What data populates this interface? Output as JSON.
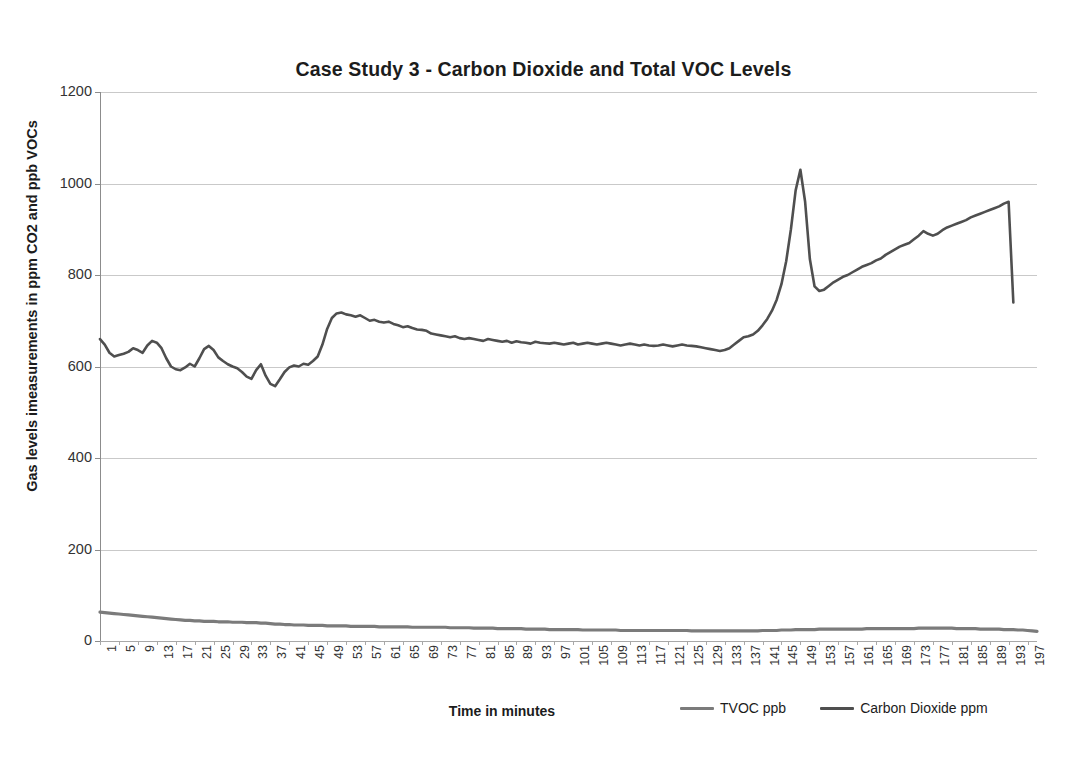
{
  "chart_data": {
    "type": "line",
    "title": "Case Study 3 - Carbon Dioxide and Total VOC Levels",
    "xlabel": "Time in minutes",
    "ylabel": "Gas levels imeasurements in ppm CO2 and ppb VOCs",
    "ylim": [
      0,
      1200
    ],
    "ytick_values": [
      0,
      200,
      400,
      600,
      800,
      1000,
      1200
    ],
    "ytick_labels": [
      "0",
      "200",
      "400",
      "600",
      "800",
      "1000",
      "1200"
    ],
    "xlim": [
      1,
      200
    ],
    "xtick_labels": [
      "1",
      "5",
      "9",
      "13",
      "17",
      "21",
      "25",
      "29",
      "33",
      "37",
      "41",
      "45",
      "49",
      "53",
      "57",
      "61",
      "65",
      "69",
      "73",
      "77",
      "81",
      "85",
      "89",
      "93",
      "97",
      "101",
      "105",
      "109",
      "113",
      "117",
      "121",
      "125",
      "129",
      "133",
      "137",
      "141",
      "145",
      "149",
      "153",
      "157",
      "161",
      "165",
      "169",
      "173",
      "177",
      "181",
      "185",
      "189",
      "193",
      "197"
    ],
    "grid": "horizontal",
    "legend_position": "bottom-right",
    "colors": {
      "tvoc": "#7b7b7b",
      "co2": "#4f4f4f",
      "gridline": "#c9c9c9",
      "title": "#1c1c1c"
    },
    "series": [
      {
        "name": "TVOC ppb",
        "color": "#7b7b7b",
        "unit": "ppb",
        "values": [
          63,
          62,
          61,
          60,
          59,
          58,
          57,
          56,
          55,
          54,
          53,
          52,
          51,
          50,
          49,
          48,
          47,
          46,
          45,
          45,
          44,
          44,
          43,
          43,
          43,
          42,
          42,
          42,
          41,
          41,
          41,
          40,
          40,
          40,
          39,
          39,
          38,
          37,
          37,
          36,
          36,
          35,
          35,
          35,
          34,
          34,
          34,
          34,
          33,
          33,
          33,
          33,
          33,
          32,
          32,
          32,
          32,
          32,
          32,
          31,
          31,
          31,
          31,
          31,
          31,
          31,
          30,
          30,
          30,
          30,
          30,
          30,
          30,
          30,
          29,
          29,
          29,
          29,
          29,
          28,
          28,
          28,
          28,
          28,
          27,
          27,
          27,
          27,
          27,
          27,
          26,
          26,
          26,
          26,
          26,
          25,
          25,
          25,
          25,
          25,
          25,
          25,
          24,
          24,
          24,
          24,
          24,
          24,
          24,
          24,
          23,
          23,
          23,
          23,
          23,
          23,
          23,
          23,
          23,
          23,
          23,
          23,
          23,
          23,
          23,
          22,
          22,
          22,
          22,
          22,
          22,
          22,
          22,
          22,
          22,
          22,
          22,
          22,
          22,
          22,
          23,
          23,
          23,
          23,
          24,
          24,
          24,
          25,
          25,
          25,
          25,
          25,
          26,
          26,
          26,
          26,
          26,
          26,
          26,
          26,
          26,
          26,
          27,
          27,
          27,
          27,
          27,
          27,
          27,
          27,
          27,
          27,
          27,
          28,
          28,
          28,
          28,
          28,
          28,
          28,
          28,
          27,
          27,
          27,
          27,
          27,
          26,
          26,
          26,
          26,
          26,
          25,
          25,
          25,
          24,
          24,
          23,
          22,
          21
        ]
      },
      {
        "name": "Carbon Dioxide ppm",
        "color": "#4f4f4f",
        "unit": "ppm",
        "values": [
          660,
          648,
          630,
          622,
          625,
          628,
          632,
          640,
          636,
          630,
          646,
          656,
          652,
          640,
          618,
          600,
          594,
          592,
          598,
          606,
          600,
          618,
          638,
          645,
          636,
          620,
          612,
          605,
          600,
          596,
          588,
          578,
          573,
          592,
          605,
          580,
          562,
          557,
          572,
          588,
          598,
          602,
          600,
          606,
          604,
          612,
          622,
          648,
          682,
          706,
          716,
          718,
          714,
          712,
          709,
          712,
          706,
          700,
          702,
          698,
          696,
          698,
          693,
          690,
          686,
          688,
          684,
          681,
          680,
          678,
          672,
          670,
          668,
          666,
          664,
          666,
          662,
          660,
          662,
          660,
          658,
          656,
          660,
          658,
          656,
          654,
          656,
          652,
          655,
          653,
          652,
          650,
          654,
          652,
          651,
          650,
          652,
          650,
          648,
          650,
          652,
          648,
          650,
          652,
          650,
          648,
          650,
          652,
          650,
          648,
          646,
          648,
          650,
          648,
          646,
          648,
          646,
          645,
          646,
          648,
          646,
          644,
          646,
          648,
          646,
          645,
          644,
          642,
          640,
          638,
          636,
          634,
          636,
          640,
          648,
          656,
          664,
          666,
          670,
          678,
          690,
          704,
          722,
          746,
          780,
          830,
          900,
          985,
          1030,
          960,
          835,
          775,
          765,
          768,
          776,
          784,
          790,
          796,
          800,
          806,
          812,
          818,
          822,
          826,
          832,
          836,
          844,
          850,
          856,
          862,
          866,
          870,
          878,
          886,
          896,
          890,
          886,
          890,
          898,
          904,
          908,
          912,
          916,
          920,
          926,
          930,
          934,
          938,
          942,
          946,
          950,
          956,
          960,
          740
        ]
      }
    ]
  },
  "axes": {
    "yaxis_title": "Gas levels imeasurements in ppm CO2 and ppb VOCs",
    "xaxis_title": "Time in minutes"
  },
  "legend": {
    "items": [
      {
        "label": "TVOC ppb",
        "color": "#7b7b7b"
      },
      {
        "label": "Carbon Dioxide ppm",
        "color": "#4f4f4f"
      }
    ]
  }
}
